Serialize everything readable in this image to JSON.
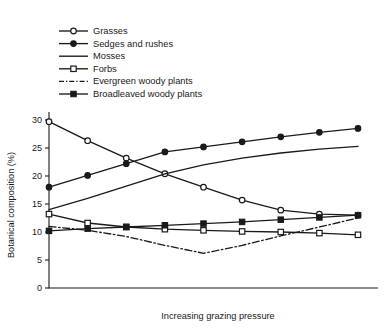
{
  "chart_data": {
    "type": "line",
    "title": "",
    "xlabel": "Increasing grazing pressure",
    "ylabel": "Botanical composition (%)",
    "x": [
      0,
      1,
      2,
      3,
      4,
      5,
      6,
      7,
      8
    ],
    "xlim": [
      0,
      8
    ],
    "ylim": [
      0,
      31
    ],
    "yticks": [
      0,
      5,
      10,
      15,
      20,
      25,
      30
    ],
    "ytick_labels": [
      "0",
      "5",
      "10",
      "15",
      "20",
      "25",
      "30"
    ],
    "xticks_shown": false,
    "grid": false,
    "legend_position": "top-left",
    "series": [
      {
        "name": "Grasses",
        "marker": "open-circle",
        "linestyle": "solid",
        "values": [
          29.7,
          26.3,
          23.2,
          20.4,
          18.0,
          15.7,
          13.9,
          13.2,
          13.0
        ]
      },
      {
        "name": "Sedges and rushes",
        "marker": "filled-circle",
        "linestyle": "solid",
        "values": [
          18.0,
          20.1,
          22.2,
          24.3,
          25.2,
          26.1,
          27.0,
          27.8,
          28.5
        ]
      },
      {
        "name": "Mosses",
        "marker": "none",
        "linestyle": "solid",
        "values": [
          14.0,
          16.0,
          18.2,
          20.4,
          22.0,
          23.2,
          24.1,
          24.8,
          25.3
        ]
      },
      {
        "name": "Forbs",
        "marker": "open-square",
        "linestyle": "solid",
        "values": [
          13.2,
          11.6,
          10.9,
          10.5,
          10.3,
          10.1,
          10.0,
          9.8,
          9.5
        ]
      },
      {
        "name": "Evergreen woody plants",
        "marker": "none",
        "linestyle": "dash-dot",
        "values": [
          11.0,
          10.3,
          9.2,
          7.6,
          6.2,
          7.6,
          9.3,
          10.9,
          12.5
        ]
      },
      {
        "name": "Broadleaved woody plants",
        "marker": "filled-square",
        "linestyle": "solid",
        "values": [
          10.2,
          10.6,
          10.9,
          11.2,
          11.5,
          11.8,
          12.2,
          12.6,
          13.0
        ]
      }
    ]
  },
  "legend": {
    "items": [
      {
        "label": "Grasses",
        "marker": "open-circle",
        "linestyle": "solid"
      },
      {
        "label": "Sedges and rushes",
        "marker": "filled-circle",
        "linestyle": "solid"
      },
      {
        "label": "Mosses",
        "marker": "none",
        "linestyle": "solid"
      },
      {
        "label": "Forbs",
        "marker": "open-square",
        "linestyle": "solid"
      },
      {
        "label": "Evergreen woody plants",
        "marker": "none",
        "linestyle": "dash-dot"
      },
      {
        "label": "Broadleaved woody plants",
        "marker": "filled-square",
        "linestyle": "solid"
      }
    ]
  },
  "colors": {
    "ink": "#1a1a1a",
    "background": "#ffffff"
  }
}
